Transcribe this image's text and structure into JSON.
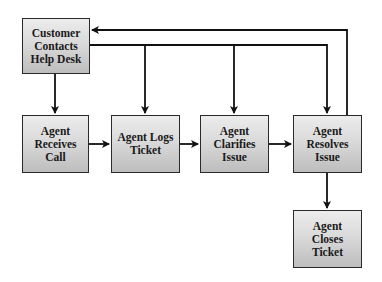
{
  "diagram": {
    "type": "flowchart",
    "nodes": [
      {
        "id": "customer",
        "label": "Customer Contacts Help Desk"
      },
      {
        "id": "receives",
        "label": "Agent Receives Call"
      },
      {
        "id": "logs",
        "label": "Agent Logs Ticket"
      },
      {
        "id": "clarifies",
        "label": "Agent Clarifies Issue"
      },
      {
        "id": "resolves",
        "label": "Agent Resolves Issue"
      },
      {
        "id": "closes",
        "label": "Agent Closes Ticket"
      }
    ],
    "edges": [
      {
        "from": "customer",
        "to": "receives"
      },
      {
        "from": "customer",
        "to": "logs"
      },
      {
        "from": "customer",
        "to": "clarifies"
      },
      {
        "from": "customer",
        "to": "resolves"
      },
      {
        "from": "receives",
        "to": "logs"
      },
      {
        "from": "logs",
        "to": "clarifies"
      },
      {
        "from": "clarifies",
        "to": "resolves"
      },
      {
        "from": "resolves",
        "to": "closes"
      },
      {
        "from": "resolves",
        "to": "customer"
      }
    ],
    "colors": {
      "border": "#2a2a2a",
      "fill_top": "#ececec",
      "fill_bottom": "#bdbdbd",
      "line": "#111111"
    }
  }
}
